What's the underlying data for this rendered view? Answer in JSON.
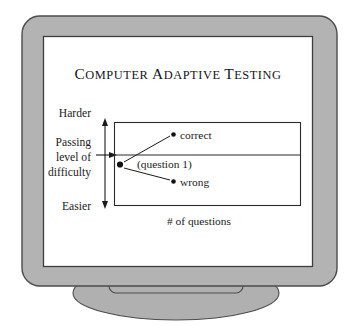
{
  "figure": {
    "kind": "monitor-illustration",
    "title": "Computer Adaptive Testing",
    "title_words": [
      "Computer",
      "Adaptive",
      "Testing"
    ]
  },
  "colors": {
    "bezel_fill": "#b3b3b3",
    "bezel_stroke": "#4c4c4c",
    "screen_fill": "#ffffff",
    "screen_stroke": "#3d3d3d",
    "stand_fill": "#b0b0b0",
    "stand_stroke": "#4c4c4c",
    "ink": "#1a1a1a",
    "page_background": "#ffffff"
  },
  "chart": {
    "y_axis": {
      "top_label": "Harder",
      "bottom_label": "Easier",
      "middle_label_lines": [
        "Passing",
        "level of",
        "difficulty"
      ],
      "middle_label_text": "Passing level of difficulty",
      "arrow_style": "double-headed-vertical"
    },
    "x_axis": {
      "label": "# of questions"
    },
    "threshold_line": {
      "name": "passing-level-line",
      "description": "horizontal line across plot at passing level of difficulty"
    },
    "nodes": [
      {
        "id": "root",
        "label": "(question 1)",
        "marker": "filled-dot",
        "position": "left, at passing level"
      },
      {
        "id": "correct",
        "label": "correct",
        "marker": "filled-dot",
        "position": "upper branch, above passing line"
      },
      {
        "id": "wrong",
        "label": "wrong",
        "marker": "filled-dot",
        "position": "lower branch, below passing line"
      }
    ],
    "edges": [
      {
        "from": "root",
        "to": "correct"
      },
      {
        "from": "root",
        "to": "wrong"
      }
    ]
  }
}
